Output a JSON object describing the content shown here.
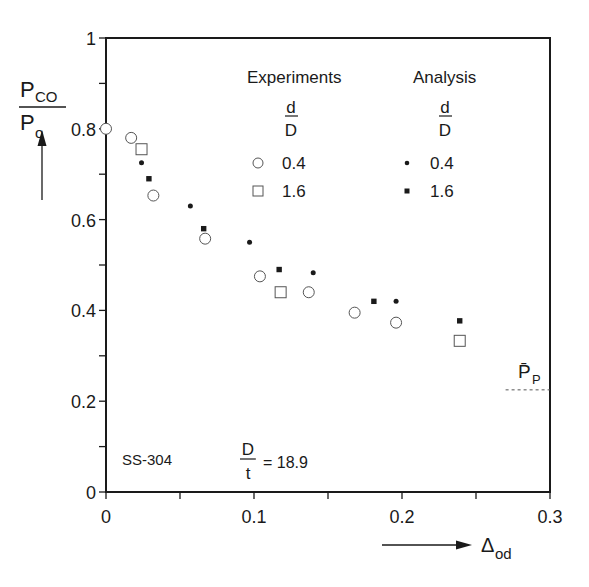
{
  "chart_data": {
    "type": "scatter",
    "title": "",
    "ylabel": {
      "num": "P",
      "num_sub": "CO",
      "den": "P",
      "den_sub": "o"
    },
    "xlabel": {
      "main": "Δ",
      "sub": "od"
    },
    "xlim": [
      0,
      0.3
    ],
    "ylim": [
      0,
      1
    ],
    "xticks": [
      "0",
      "0.1",
      "0.2",
      "0.3"
    ],
    "yticks": [
      "0",
      "0.2",
      "0.4",
      "0.6",
      "0.8",
      "1"
    ],
    "grid": false,
    "legend": {
      "position": "upper right",
      "groups": [
        {
          "title": "Experiments",
          "param_num": "d",
          "param_den": "D",
          "entries": [
            {
              "marker": "open-circle",
              "label": "0.4"
            },
            {
              "marker": "open-square",
              "label": "1.6"
            }
          ]
        },
        {
          "title": "Analysis",
          "param_num": "d",
          "param_den": "D",
          "entries": [
            {
              "marker": "filled-dot",
              "label": "0.4"
            },
            {
              "marker": "filled-square",
              "label": "1.6"
            }
          ]
        }
      ]
    },
    "series": [
      {
        "name": "Experiments d/D=0.4",
        "marker": "open-circle",
        "x": [
          0.0,
          0.017,
          0.032,
          0.067,
          0.104,
          0.137,
          0.168,
          0.196
        ],
        "y": [
          0.8,
          0.78,
          0.653,
          0.558,
          0.475,
          0.44,
          0.395,
          0.373
        ]
      },
      {
        "name": "Experiments d/D=1.6",
        "marker": "open-square",
        "x": [
          0.024,
          0.118,
          0.239
        ],
        "y": [
          0.755,
          0.44,
          0.333
        ]
      },
      {
        "name": "Analysis d/D=0.4",
        "marker": "filled-dot",
        "x": [
          0.024,
          0.057,
          0.097,
          0.14,
          0.196
        ],
        "y": [
          0.725,
          0.63,
          0.55,
          0.483,
          0.42
        ]
      },
      {
        "name": "Analysis d/D=1.6",
        "marker": "filled-square",
        "x": [
          0.029,
          0.066,
          0.117,
          0.181,
          0.239
        ],
        "y": [
          0.69,
          0.58,
          0.49,
          0.42,
          0.377
        ]
      }
    ],
    "reference_line": {
      "label": "P̄",
      "label_sub": "P",
      "y": 0.225,
      "x_from": 0.27,
      "x_to": 0.3,
      "style": "dashed"
    },
    "annotations": [
      {
        "text": "SS-304"
      },
      {
        "text": "= 18.9",
        "frac_num": "D",
        "frac_den": "t"
      }
    ]
  }
}
